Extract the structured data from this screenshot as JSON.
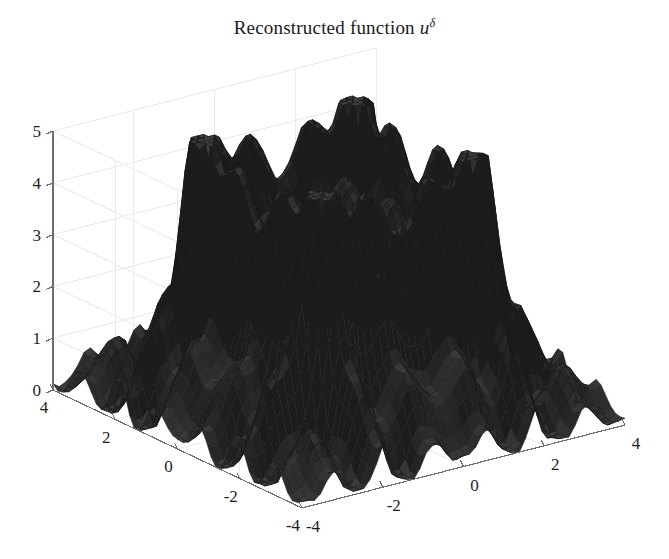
{
  "figure": {
    "width": 669,
    "height": 559,
    "background": "#ffffff",
    "title_prefix": "Reconstructed function ",
    "title_variable": "u",
    "title_superscript": "δ",
    "title_full": "Reconstructed function uδ"
  },
  "axes": {
    "grid_color": "#e9e9e9",
    "axis_line_color": "#6e6e6e",
    "mesh_color": "#1c1c1c",
    "surface_face_color": "#2e2e2e",
    "z": {
      "label": "",
      "ticks": [
        "0",
        "1",
        "2",
        "3",
        "4",
        "5"
      ],
      "values": [
        0,
        1,
        2,
        3,
        4,
        5
      ],
      "limits": [
        0,
        5
      ]
    },
    "x_right": {
      "label": "",
      "ticks": [
        "-4",
        "-2",
        "0",
        "2",
        "4"
      ],
      "values": [
        -4,
        -2,
        0,
        2,
        4
      ],
      "limits": [
        -4,
        4
      ]
    },
    "y_left": {
      "label": "",
      "ticks": [
        "4",
        "2",
        "0",
        "-2",
        "-4"
      ],
      "values": [
        4,
        2,
        0,
        -2,
        -4
      ],
      "limits": [
        -4,
        4
      ]
    }
  },
  "chart_data": {
    "type": "surface",
    "title": "Reconstructed function uδ",
    "xlabel": "",
    "ylabel": "",
    "zlabel": "",
    "xlim": [
      -4,
      4
    ],
    "ylim": [
      -4,
      4
    ],
    "zlim": [
      0,
      5
    ],
    "xticks": [
      -4,
      -2,
      0,
      2,
      4
    ],
    "yticks": [
      -4,
      -2,
      0,
      2,
      4
    ],
    "zticks": [
      0,
      1,
      2,
      3,
      4,
      5
    ],
    "grid": true,
    "legend": "none",
    "render": "wireframe-mesh",
    "mesh_resolution": [
      52,
      52
    ],
    "view_azimuth_deg": -37.5,
    "view_elevation_deg": 22,
    "features": {
      "plateau_level": 3.7,
      "plateau_half_width": 1.9,
      "peak_value": 4.45,
      "skirt_level": 1.0,
      "undershoot_min": 0.0,
      "baseline": 0.0,
      "ring_wavelength": 1.25
    },
    "annotations": []
  }
}
